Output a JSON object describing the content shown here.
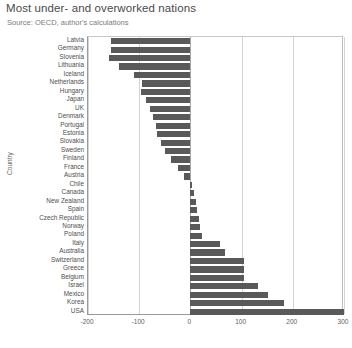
{
  "chart_data": {
    "type": "bar",
    "orientation": "horizontal",
    "title": "Most under- and overworked nations",
    "subtitle": "Source: OECD, author's calculations",
    "xlabel": "",
    "ylabel": "Country",
    "xlim": [
      -200,
      300
    ],
    "xticks": [
      -200,
      -100,
      0,
      100,
      200,
      300
    ],
    "xtick_labels": [
      "-200",
      "-100",
      "0",
      "100",
      "200",
      "300"
    ],
    "grid": true,
    "legend": "none",
    "bar_color": "#595959",
    "categories": [
      "Latvia",
      "Germany",
      "Slovenia",
      "Lithuania",
      "Iceland",
      "Netherlands",
      "Hungary",
      "Japan",
      "UK",
      "Denmark",
      "Portugal",
      "Estonia",
      "Slovakia",
      "Sweden",
      "Finland",
      "France",
      "Austria",
      "Chile",
      "Canada",
      "New Zealand",
      "Spain",
      "Czech Republic",
      "Norway",
      "Poland",
      "Italy",
      "Australia",
      "Switzerland",
      "Greece",
      "Belgium",
      "Israel",
      "Mexico",
      "Korea",
      "USA"
    ],
    "values": [
      -155,
      -155,
      -159,
      -140,
      -111,
      -94,
      -96,
      -87,
      -79,
      -74,
      -68,
      -66,
      -57,
      -49,
      -38,
      -25,
      -12,
      4,
      8,
      10,
      13,
      17,
      19,
      22,
      57,
      68,
      104,
      104,
      104,
      132,
      151,
      183,
      300
    ]
  }
}
